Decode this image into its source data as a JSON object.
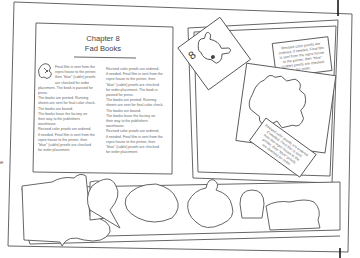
{
  "illustration": {
    "subject": "open pop-up book spread",
    "left_page": {
      "chapter_label": "Chapter 8",
      "chapter_title": "Fad Books",
      "column_1": [
        "Final film is sent from the",
        "repro house to the printer,",
        "then \"blue\" (cable) proofs",
        "are checked for order",
        "placement. The book is passed for",
        "press.",
        "  The books are printed. Running",
        "sheets are sent for final color check.",
        "The books are bound.",
        "  The books leave the factory on",
        "their way to the publishers",
        "warehouse.",
        "  Revised color proofs are ordered,",
        "if needed. Final film is sent from the",
        "repro house to the printer, then",
        "\"blue\" (cable) proofs are checked",
        "for order placement."
      ],
      "column_2": [
        "  Revised color proofs are ordered,",
        "if needed. Final film is sent from the",
        "repro house to the printer, then",
        "\"blue\" (cable) proofs are checked",
        "for order placement. The book is",
        "passed for press.",
        "  The books are printed. Running",
        "sheets are sent for final color check.",
        "The books are bound.",
        "  The books leave the factory on",
        "their way to the publishers",
        "warehouse.",
        "  Revised color proofs are ordered,",
        "if needed. Final film is sent from the",
        "repro house to the printer, then",
        "\"blue\" (cable) proofs are checked",
        "for order placement."
      ]
    },
    "right_page": {
      "card_number": "8",
      "note_card_text": [
        "Revised color proofs are",
        "ordered, if needed. Final film",
        "is sent from the repro house",
        "to the printer, then \"blue\"",
        "(cable) proofs are checked",
        "for order."
      ],
      "tilted_card_text": [
        "Revised color proofs are ordered,",
        "if needed. Final film is sent",
        "from the repro house to the",
        "printer, then \"blue\" proofs",
        "are checked for order."
      ]
    },
    "left_edge_fragment": "e",
    "colors": {
      "line": "#555555",
      "text": "#666666",
      "paper": "#ffffff",
      "dark_mark": "#1a1a1a"
    }
  }
}
